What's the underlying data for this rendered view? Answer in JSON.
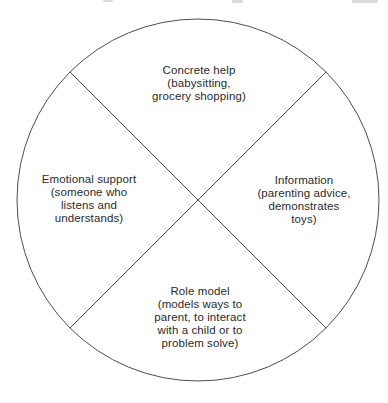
{
  "diagram": {
    "shape": "circle",
    "divider": "diagonal-cross",
    "line_color": "#4d4d4d",
    "text_color": "#2a2a2a",
    "background_color": "#ffffff",
    "quadrants": [
      {
        "position": "top",
        "label": "Concrete help",
        "description_lines": [
          "(babysitting,",
          "grocery shopping)"
        ]
      },
      {
        "position": "left",
        "label": "Emotional support",
        "description_lines": [
          "(someone who",
          "listens and",
          "understands)"
        ]
      },
      {
        "position": "right",
        "label": "Information",
        "description_lines": [
          "(parenting advice,",
          "demonstrates",
          "toys)"
        ]
      },
      {
        "position": "bottom",
        "label": "Role model",
        "description_lines": [
          "(models ways to",
          "parent, to interact",
          "with a child or to",
          "problem solve)"
        ]
      }
    ]
  }
}
